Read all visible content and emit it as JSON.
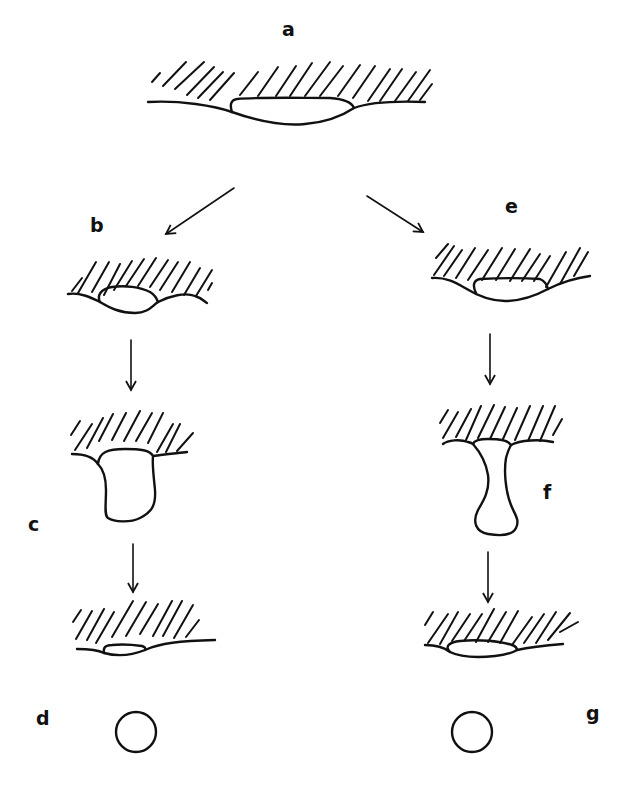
{
  "figure": {
    "panels": [
      {
        "id": "a",
        "label": "a",
        "description": "flat lens-shaped inclusion at interface below hatched surface"
      },
      {
        "id": "b",
        "label": "b",
        "description": "smaller lens pinched at interface"
      },
      {
        "id": "c",
        "label": "c",
        "description": "rounded column hanging from surface"
      },
      {
        "id": "d",
        "label": "d",
        "description": "small lens remnant and detached sphere"
      },
      {
        "id": "e",
        "label": "e",
        "description": "lens at sloped interface"
      },
      {
        "id": "f",
        "label": "f",
        "description": "necked column (hourglass) hanging from surface"
      },
      {
        "id": "g",
        "label": "g",
        "description": "small lens remnant and detached sphere"
      }
    ],
    "arrows": [
      {
        "from": "a",
        "to": "b"
      },
      {
        "from": "a",
        "to": "e"
      },
      {
        "from": "b",
        "to": "c"
      },
      {
        "from": "c",
        "to": "d"
      },
      {
        "from": "e",
        "to": "f"
      },
      {
        "from": "f",
        "to": "g"
      }
    ],
    "colors": {
      "ink": "#111111",
      "background": "#ffffff"
    }
  }
}
